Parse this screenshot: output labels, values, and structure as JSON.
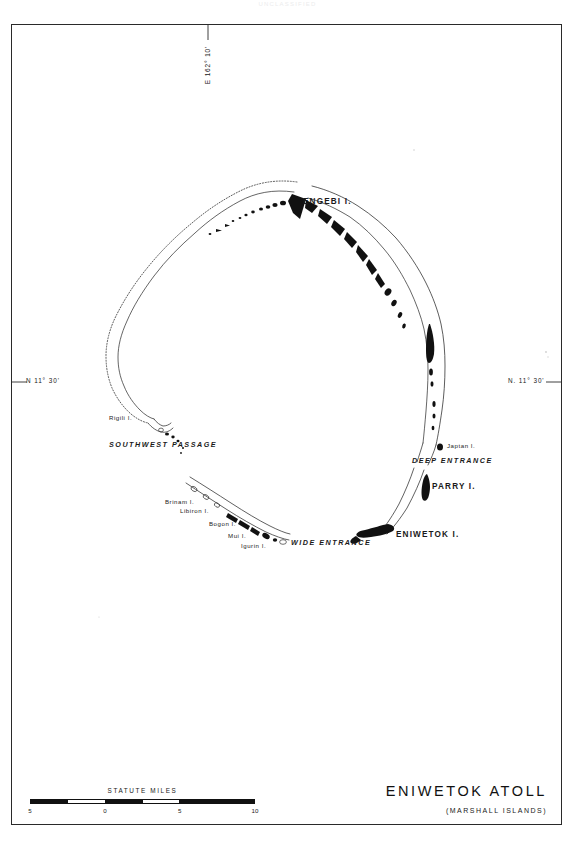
{
  "scan": {
    "header_artifact": "UNCLASSIFIED"
  },
  "map": {
    "title": "ENIWETOK ATOLL",
    "subtitle": "(MARSHALL ISLANDS)",
    "graticule": {
      "longitude_label": "E 162° 10'",
      "latitude_label_left": "N 11° 30'",
      "latitude_label_right": "N. 11° 30'"
    },
    "scale": {
      "title": "STATUTE MILES",
      "unit": "statute miles",
      "ticks": [
        "5",
        "0",
        "5",
        "10"
      ],
      "tick_positions_pct": [
        0,
        33.3,
        66.6,
        100
      ]
    },
    "features": [
      {
        "name": "ENGEBI I.",
        "type": "island-major",
        "x": 303,
        "y": 198
      },
      {
        "name": "Japtan I.",
        "type": "island-minor",
        "x": 447,
        "y": 447
      },
      {
        "name": "DEEP ENTRANCE",
        "type": "passage",
        "x": 412,
        "y": 461
      },
      {
        "name": "PARRY I.",
        "type": "island-major",
        "x": 432,
        "y": 487
      },
      {
        "name": "ENIWETOK I.",
        "type": "island-major",
        "x": 396,
        "y": 535
      },
      {
        "name": "WIDE ENTRANCE",
        "type": "passage",
        "x": 291,
        "y": 543
      },
      {
        "name": "Igurin I.",
        "type": "island-minor",
        "x": 241,
        "y": 546
      },
      {
        "name": "Mui I.",
        "type": "island-minor",
        "x": 228,
        "y": 536
      },
      {
        "name": "Bogon I.",
        "type": "island-minor",
        "x": 212,
        "y": 525
      },
      {
        "name": "Libiron I.",
        "type": "island-minor",
        "x": 180,
        "y": 511
      },
      {
        "name": "Brinam I.",
        "type": "island-minor",
        "x": 167,
        "y": 502
      },
      {
        "name": "Rigili I.",
        "type": "island-minor",
        "x": 109,
        "y": 418
      },
      {
        "name": "SOUTHWEST PASSAGE",
        "type": "passage",
        "x": 109,
        "y": 445
      }
    ]
  }
}
